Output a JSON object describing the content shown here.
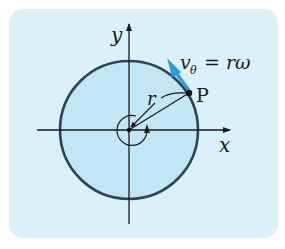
{
  "diagram": {
    "labels": {
      "x_axis": "x",
      "y_axis": "y",
      "radius": "r",
      "point": "P",
      "velocity_main": "v",
      "velocity_sub": "θ",
      "velocity_rhs": "= rω"
    },
    "colors": {
      "panel_background": "#daf1fa",
      "disk_fill": "#c2e6f5",
      "disk_outline": "#2d4456",
      "velocity_arrow": "#2a9de0",
      "axis": "#1a1a1a"
    }
  }
}
